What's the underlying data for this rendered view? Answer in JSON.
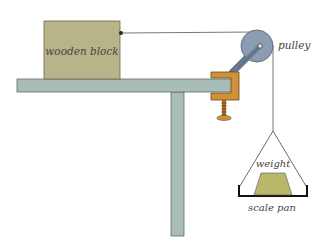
{
  "diagram": {
    "labels": {
      "block": "wooden block",
      "pulley": "pulley",
      "weight": "weight",
      "pan": "scale pan"
    },
    "colors": {
      "block": "#b8b48a",
      "table": "#a9bdb8",
      "clamp": "#d1913a",
      "pulley": "#8c9cb3",
      "weight": "#b9b86a",
      "string": "#333333"
    }
  }
}
